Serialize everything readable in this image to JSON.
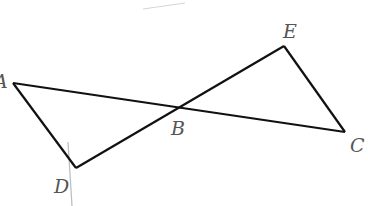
{
  "diagram": {
    "type": "geometry",
    "colors": {
      "line": "#111111",
      "label": "#555555",
      "faint": "#bdbdbd"
    },
    "points": {
      "A": {
        "label": "A",
        "x": 13,
        "y": 83
      },
      "B": {
        "label": "B",
        "x": 179,
        "y": 105
      },
      "C": {
        "label": "C",
        "x": 345,
        "y": 132
      },
      "D": {
        "label": "D",
        "x": 76,
        "y": 168
      },
      "E": {
        "label": "E",
        "x": 284,
        "y": 46
      }
    },
    "segments": [
      [
        "A",
        "C"
      ],
      [
        "D",
        "E"
      ],
      [
        "A",
        "D"
      ],
      [
        "E",
        "C"
      ]
    ],
    "labels": {
      "A": "A",
      "B": "B",
      "C": "C",
      "D": "D",
      "E": "E"
    }
  }
}
